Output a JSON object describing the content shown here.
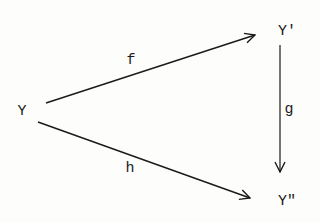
{
  "diagram": {
    "type": "commutative-triangle",
    "background": "#fdfdfb",
    "ink": "#1a1a1a",
    "nodes": [
      {
        "id": "Y",
        "label": "Y",
        "x": 22,
        "y": 112
      },
      {
        "id": "Y1",
        "label": "Y'",
        "x": 287,
        "y": 32
      },
      {
        "id": "Y2",
        "label": "Y\"",
        "x": 287,
        "y": 202
      }
    ],
    "edges": [
      {
        "id": "f",
        "from": "Y",
        "to": "Y'",
        "label": "f",
        "x1": 46,
        "y1": 103,
        "x2": 255,
        "y2": 35,
        "label_x": 131,
        "label_y": 61
      },
      {
        "id": "g",
        "from": "Y'",
        "to": "Y\"",
        "label": "g",
        "x1": 280,
        "y1": 45,
        "x2": 280,
        "y2": 172,
        "label_x": 289,
        "label_y": 110
      },
      {
        "id": "h",
        "from": "Y",
        "to": "Y\"",
        "label": "h",
        "x1": 38,
        "y1": 122,
        "x2": 250,
        "y2": 198,
        "label_x": 130,
        "label_y": 169
      }
    ]
  }
}
